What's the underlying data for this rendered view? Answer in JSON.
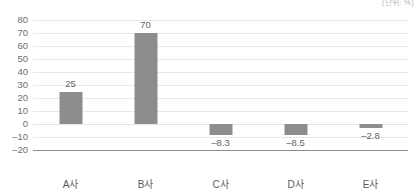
{
  "caption": "(단위: %)",
  "chart_data": {
    "type": "bar",
    "title": "",
    "subtitle": "",
    "xlabel": "",
    "ylabel": "",
    "unit": "(단위: %)",
    "categories": [
      "A사",
      "B사",
      "C사",
      "D사",
      "E사"
    ],
    "values": [
      25,
      70,
      -8.3,
      -8.5,
      -2.8
    ],
    "value_labels": [
      "25",
      "70",
      "-8.3",
      "-8.5",
      "-2.8"
    ],
    "ylim": [
      -20,
      80
    ],
    "yticks": [
      80,
      70,
      60,
      50,
      40,
      30,
      20,
      10,
      0,
      -10,
      -20
    ],
    "ytick_labels": [
      "80",
      "70",
      "60",
      "50",
      "40",
      "30",
      "20",
      "10",
      "0",
      "-10",
      "-20"
    ],
    "grid": true,
    "legend": "none",
    "series": [
      {
        "name": "",
        "color": "#8d8d8d",
        "values": [
          25,
          70,
          -8.3,
          -8.5,
          -2.8
        ]
      }
    ]
  }
}
